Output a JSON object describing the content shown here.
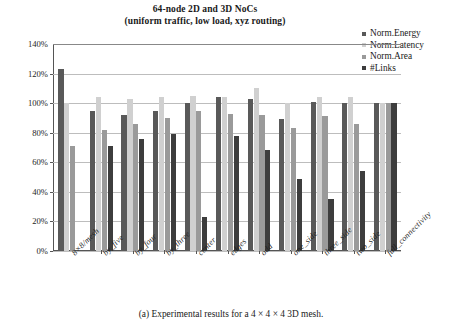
{
  "chart_data": {
    "type": "bar",
    "title": "64-node 2D and 3D NoCs",
    "subtitle": "(uniform traffic, low load, xyz routing)",
    "xlabel": "",
    "ylabel": "",
    "ylim": [
      0,
      140
    ],
    "ytick_labels": [
      "0%",
      "20%",
      "40%",
      "60%",
      "80%",
      "100%",
      "120%",
      "140%"
    ],
    "ytick_values": [
      0,
      20,
      40,
      60,
      80,
      100,
      120,
      140
    ],
    "grid": true,
    "legend_position": "top-right",
    "categories": [
      "8×8/mesh",
      "by_five",
      "by_four",
      "by_three",
      "center",
      "edges",
      "odd",
      "one_side",
      "three_side",
      "two_side",
      "full_connectivity"
    ],
    "series": [
      {
        "name": "Norm.Energy",
        "color": "#595959",
        "values": [
          123,
          95,
          92,
          95,
          100,
          104,
          103,
          89,
          101,
          100,
          100
        ]
      },
      {
        "name": "Norm.Latency",
        "color": "#d0d0d0",
        "values": [
          100,
          104,
          103,
          104,
          105,
          104,
          110,
          100,
          104,
          104,
          100
        ]
      },
      {
        "name": "Norm.Area",
        "color": "#9a9a9a",
        "values": [
          71,
          82,
          86,
          90,
          95,
          93,
          92,
          83,
          91,
          86,
          100
        ]
      },
      {
        "name": "#Links",
        "color": "#3d3d3d",
        "values": [
          0,
          71,
          76,
          79,
          23,
          78,
          68,
          49,
          35,
          54,
          100
        ]
      }
    ]
  },
  "legend": {
    "items": [
      {
        "label": "Norm.Energy",
        "color": "#595959"
      },
      {
        "label": "Norm.Latency",
        "color": "#d0d0d0"
      },
      {
        "label": "Norm.Area",
        "color": "#9a9a9a"
      },
      {
        "label": "#Links",
        "color": "#3d3d3d"
      }
    ]
  },
  "caption": "(a) Experimental results for a 4 × 4 × 4 3D mesh."
}
